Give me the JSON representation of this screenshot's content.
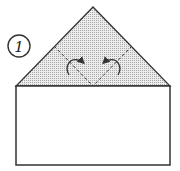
{
  "diagram": {
    "type": "origami-fold-step",
    "step_number": "1",
    "colors": {
      "background": "#ffffff",
      "line": "#333333",
      "shaded_flap": "#d9d9d9"
    },
    "shapes": {
      "rectangle": {
        "x": 16,
        "y": 86,
        "width": 154,
        "height": 79
      },
      "triangle_flap": {
        "apex": [
          93,
          7
        ],
        "left": [
          16,
          86
        ],
        "right": [
          170,
          86
        ]
      },
      "valley_fold_lines": [
        {
          "from": [
            54,
            46
          ],
          "to": [
            93,
            86
          ]
        },
        {
          "from": [
            132,
            46
          ],
          "to": [
            93,
            86
          ]
        }
      ],
      "fold_arrows": [
        {
          "direction": "fold-right",
          "position": [
            75,
            65
          ]
        },
        {
          "direction": "fold-left",
          "position": [
            112,
            65
          ]
        }
      ]
    }
  }
}
